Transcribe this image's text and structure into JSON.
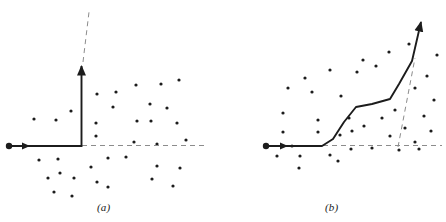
{
  "figure": {
    "panels": [
      {
        "id": "panel-a",
        "caption": "(a)",
        "description": "Right-angle vector path with scattered points",
        "start_marker": {
          "x": 9,
          "y": 146,
          "r": 3.2
        },
        "solid_path": "M 9,146 L 81.5,146 L 81.5,66",
        "arrow_head_horizontal": {
          "x": 30,
          "y": 146,
          "dir": "right"
        },
        "arrow_head_vertical": {
          "x": 81.5,
          "y": 64,
          "dir": "up"
        },
        "dashed_paths": [
          "M 82,145.5 L 205,145.5",
          "M 83,62 L 89,12"
        ],
        "points": [
          [
            34,
            119
          ],
          [
            56,
            120
          ],
          [
            71,
            111
          ],
          [
            97,
            94
          ],
          [
            96,
            123
          ],
          [
            116,
            92
          ],
          [
            136,
            85
          ],
          [
            161,
            84
          ],
          [
            179,
            80
          ],
          [
            113,
            107
          ],
          [
            150,
            104
          ],
          [
            167,
            108
          ],
          [
            137,
            121
          ],
          [
            151,
            121
          ],
          [
            177,
            123
          ],
          [
            96,
            136
          ],
          [
            134,
            142
          ],
          [
            157,
            144
          ],
          [
            186,
            140
          ],
          [
            39,
            160
          ],
          [
            58,
            159
          ],
          [
            91,
            167
          ],
          [
            108,
            158
          ],
          [
            126,
            157
          ],
          [
            60,
            173
          ],
          [
            157,
            166
          ],
          [
            180,
            168
          ],
          [
            48,
            178
          ],
          [
            74,
            178
          ],
          [
            97,
            182
          ],
          [
            108,
            187
          ],
          [
            152,
            179
          ],
          [
            173,
            186
          ],
          [
            54,
            192
          ],
          [
            72,
            196
          ]
        ]
      },
      {
        "id": "panel-b",
        "caption": "(b)",
        "description": "Smoothed staircase vector path with scattered points",
        "start_marker": {
          "x": 266,
          "y": 146,
          "r": 3.2
        },
        "solid_path": "M 266,146 L 322,146 L 333,139 L 344,122 L 356,107 L 372,104 L 390,99 L 399,84 L 412,61 L 421,22",
        "arrow_head_horizontal": {
          "x": 288,
          "y": 146,
          "dir": "right"
        },
        "arrow_head_vertical": {
          "x": 423,
          "y": 17,
          "dir": "up-right"
        },
        "dashed_paths": [
          "M 323,145.5 L 442,145.5",
          "M 398,147 L 415,58"
        ],
        "points": [
          [
            283,
            132
          ],
          [
            292,
            146
          ],
          [
            300,
            156
          ],
          [
            277,
            156
          ],
          [
            283,
            113
          ],
          [
            288,
            88
          ],
          [
            312,
            92
          ],
          [
            318,
            120
          ],
          [
            305,
            78
          ],
          [
            330,
            70
          ],
          [
            341,
            96
          ],
          [
            349,
            118
          ],
          [
            357,
            72
          ],
          [
            363,
            60
          ],
          [
            376,
            66
          ],
          [
            389,
            52
          ],
          [
            340,
            135
          ],
          [
            352,
            131
          ],
          [
            364,
            126
          ],
          [
            318,
            132
          ],
          [
            382,
            118
          ],
          [
            395,
            110
          ],
          [
            405,
            128
          ],
          [
            390,
            136
          ],
          [
            415,
            88
          ],
          [
            427,
            76
          ],
          [
            434,
            100
          ],
          [
            424,
            116
          ],
          [
            431,
            131
          ],
          [
            415,
            142
          ],
          [
            437,
            55
          ],
          [
            409,
            44
          ],
          [
            351,
            149
          ],
          [
            372,
            148
          ],
          [
            399,
            150
          ],
          [
            419,
            149
          ],
          [
            330,
            155
          ],
          [
            299,
            168
          ],
          [
            338,
            161
          ]
        ]
      }
    ],
    "style": {
      "line_color": "#1c1c1c",
      "dash_color": "#8c8c8c",
      "point_color": "#1c1c1c",
      "background": "#ffffff",
      "solid_width": 1.9,
      "dash_width": 1.0,
      "point_radius": 1.6
    }
  }
}
